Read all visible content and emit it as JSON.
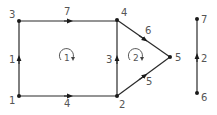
{
  "colors": {
    "edge": "#2a2a2a",
    "node": "#1a1a1a",
    "label": "#555555",
    "background": "#ffffff"
  },
  "graph": {
    "nodes": [
      {
        "id": "1",
        "label": "1",
        "x": 19,
        "y": 96
      },
      {
        "id": "2",
        "label": "2",
        "x": 117,
        "y": 96
      },
      {
        "id": "3",
        "label": "3",
        "x": 19,
        "y": 21
      },
      {
        "id": "4",
        "label": "4",
        "x": 117,
        "y": 20
      },
      {
        "id": "5",
        "label": "5",
        "x": 170,
        "y": 57
      },
      {
        "id": "6",
        "label": "6",
        "x": 197,
        "y": 93
      },
      {
        "id": "7",
        "label": "7",
        "x": 197,
        "y": 19
      }
    ],
    "edges": [
      {
        "from": "1",
        "to": "3",
        "label": "1"
      },
      {
        "from": "3",
        "to": "4",
        "label": "7"
      },
      {
        "from": "1",
        "to": "2",
        "label": "4"
      },
      {
        "from": "2",
        "to": "4",
        "label": "3"
      },
      {
        "from": "4",
        "to": "5",
        "label": "6"
      },
      {
        "from": "2",
        "to": "5",
        "label": "5"
      },
      {
        "from": "6",
        "to": "7",
        "label": "2"
      }
    ],
    "loops": [
      {
        "label": "1",
        "direction": "clockwise"
      },
      {
        "label": "2",
        "direction": "clockwise"
      }
    ]
  }
}
